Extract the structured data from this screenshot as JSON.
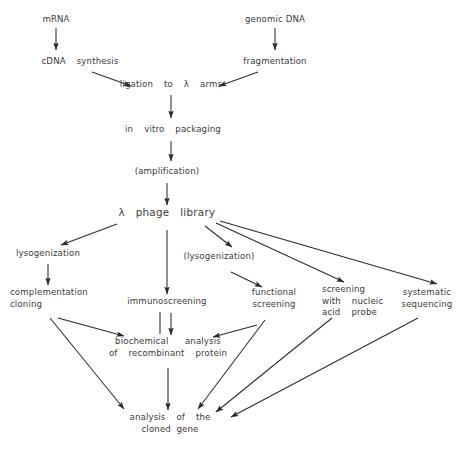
{
  "diagram": {
    "type": "flowchart",
    "background_color": "#ffffff",
    "text_color": "#3a3a3a",
    "edge_color": "#2b2b2b",
    "nodes": [
      {
        "id": "mrna",
        "label": "mRNA",
        "x": 56,
        "y": 20
      },
      {
        "id": "genomic_dna",
        "label": "genomic DNA",
        "x": 275,
        "y": 20
      },
      {
        "id": "cdna_synthesis",
        "label": "cDNA  synthesis",
        "x": 80,
        "y": 62
      },
      {
        "id": "fragmentation",
        "label": "fragmentation",
        "x": 275,
        "y": 62
      },
      {
        "id": "ligation",
        "label": "ligation  to  λ  arms",
        "x": 171,
        "y": 85
      },
      {
        "id": "packaging",
        "label": "in  vitro  packaging",
        "x": 173,
        "y": 130
      },
      {
        "id": "amplification",
        "label": "(amplification)",
        "x": 167,
        "y": 172
      },
      {
        "id": "phage_library",
        "label": "λ   phage   library",
        "x": 167,
        "y": 212
      },
      {
        "id": "lysogenization",
        "label": "lysogenization",
        "x": 48,
        "y": 254
      },
      {
        "id": "lysogenization2",
        "label": "(lysogenization)",
        "x": 219,
        "y": 257
      },
      {
        "id": "complementation",
        "label": "complementation\ncloning",
        "x": 10,
        "y": 293
      },
      {
        "id": "immunoscreening",
        "label": "immunoscreening",
        "x": 167,
        "y": 302
      },
      {
        "id": "functional",
        "label": "functional\nscreening",
        "x": 274,
        "y": 293
      },
      {
        "id": "nucleic_probe",
        "label": "screening\nwith  nucleic\nacid  probe",
        "x": 322,
        "y": 290
      },
      {
        "id": "systematic",
        "label": "systematic\nsequencing",
        "x": 427,
        "y": 293
      },
      {
        "id": "biochem",
        "label": "biochemical   analysis\nof  recombinant  protein",
        "x": 168,
        "y": 342
      },
      {
        "id": "cloned_gene",
        "label": "analysis  of  the\ncloned gene",
        "x": 170,
        "y": 418
      }
    ],
    "edges": [
      {
        "from": "mrna",
        "to": "cdna_synthesis"
      },
      {
        "from": "genomic_dna",
        "to": "fragmentation"
      },
      {
        "from": "cdna_synthesis",
        "to": "ligation"
      },
      {
        "from": "fragmentation",
        "to": "ligation"
      },
      {
        "from": "ligation",
        "to": "packaging"
      },
      {
        "from": "packaging",
        "to": "amplification"
      },
      {
        "from": "amplification",
        "to": "phage_library"
      },
      {
        "from": "phage_library",
        "to": "lysogenization"
      },
      {
        "from": "phage_library",
        "to": "immunoscreening"
      },
      {
        "from": "phage_library",
        "to": "lysogenization2"
      },
      {
        "from": "phage_library",
        "to": "nucleic_probe"
      },
      {
        "from": "phage_library",
        "to": "systematic"
      },
      {
        "from": "lysogenization2",
        "to": "functional"
      },
      {
        "from": "lysogenization",
        "to": "complementation"
      },
      {
        "from": "complementation",
        "to": "biochem"
      },
      {
        "from": "complementation",
        "to": "cloned_gene"
      },
      {
        "from": "immunoscreening",
        "to": "biochem"
      },
      {
        "from": "functional",
        "to": "biochem"
      },
      {
        "from": "functional",
        "to": "cloned_gene"
      },
      {
        "from": "biochem",
        "to": "cloned_gene"
      },
      {
        "from": "nucleic_probe",
        "to": "cloned_gene"
      },
      {
        "from": "systematic",
        "to": "cloned_gene"
      }
    ]
  }
}
